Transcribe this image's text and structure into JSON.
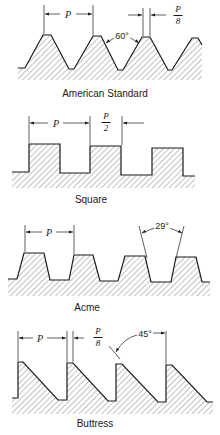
{
  "figure": {
    "panels": [
      {
        "name": "American Standard",
        "caption": "American Standard",
        "pitch_label": "P",
        "crest_flat_label": {
          "numerator": "P",
          "denominator": "8"
        },
        "angle_label": "60°"
      },
      {
        "name": "Square",
        "caption": "Square",
        "pitch_label": "P",
        "tooth_width_label": {
          "numerator": "P",
          "denominator": "2"
        }
      },
      {
        "name": "Acme",
        "caption": "Acme",
        "pitch_label": "P",
        "angle_label": "29°"
      },
      {
        "name": "Buttress",
        "caption": "Buttress",
        "pitch_label": "P",
        "crest_flat_label": {
          "numerator": "P",
          "denominator": "8"
        },
        "angle_label": "45°"
      }
    ],
    "colors": {
      "line": "#1a1a1a",
      "hatch": "#555555",
      "background": "#ffffff"
    }
  }
}
